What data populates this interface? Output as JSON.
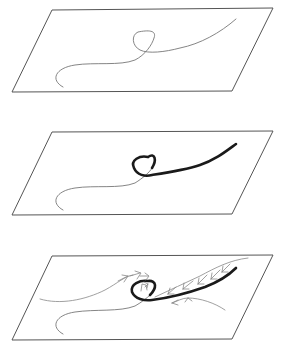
{
  "diagram": {
    "type": "three-stage schematic of a curved filament on inclined planes",
    "panels": [
      {
        "id": "panel-1",
        "description": "Thin curve with a loop lying on a plane",
        "plane_corners": [
          [
            52,
            10
          ],
          [
            273,
            8
          ],
          [
            232,
            91
          ],
          [
            12,
            92
          ]
        ],
        "colors": {
          "plane": "#555555",
          "curve": "#777777"
        }
      },
      {
        "id": "panel-2",
        "description": "Same curve; loop and right branch emphasised with thick stroke",
        "plane_corners": [
          [
            52,
            132
          ],
          [
            273,
            131
          ],
          [
            232,
            214
          ],
          [
            12,
            215
          ]
        ],
        "colors": {
          "plane": "#555555",
          "curve": "#777777",
          "emphasis": "#1a1a1a"
        }
      },
      {
        "id": "panel-3",
        "description": "Thick curve with surrounding flow lines and small arrows indicating circulation/flow",
        "plane_corners": [
          [
            52,
            256
          ],
          [
            273,
            255
          ],
          [
            232,
            339
          ],
          [
            12,
            340
          ]
        ],
        "colors": {
          "plane": "#555555",
          "curve": "#777777",
          "emphasis": "#1a1a1a",
          "flow": "#888888"
        }
      }
    ]
  }
}
